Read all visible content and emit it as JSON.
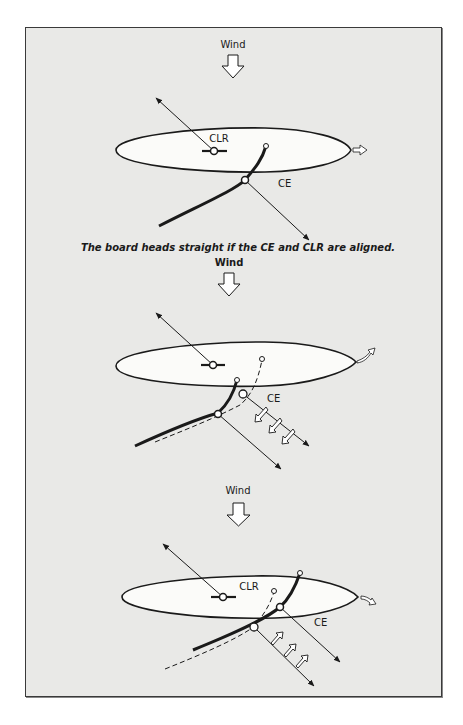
{
  "figure": {
    "panels": [
      {
        "id": "aligned",
        "wind_label": "Wind",
        "clr_label": "CLR",
        "ce_label": "CE",
        "caption": "The board heads straight if the CE and CLR are aligned.",
        "result": "straight"
      },
      {
        "id": "ce-behind",
        "wind_label": "Wind",
        "ce_label": "CE",
        "result": "turns upwind"
      },
      {
        "id": "ce-ahead",
        "wind_label": "Wind",
        "clr_label": "CLR",
        "ce_label": "CE",
        "result": "turns downwind"
      }
    ],
    "colors": {
      "background": "#e9e9e7",
      "board_fill": "#fbfbf9",
      "ink": "#1a1a1a"
    }
  }
}
